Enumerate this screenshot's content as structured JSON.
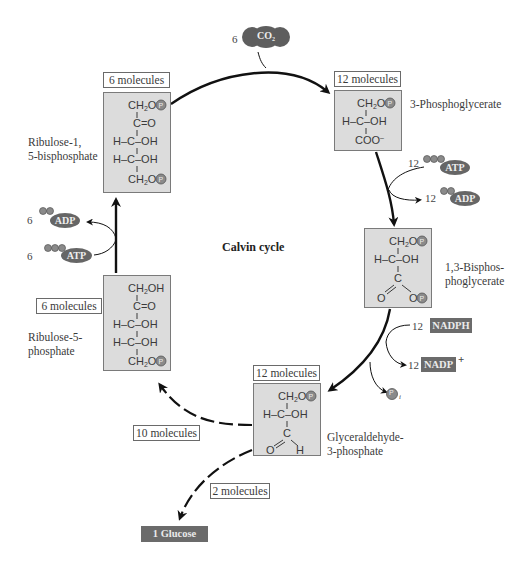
{
  "diagram": {
    "title": "Calvin cycle",
    "colors": {
      "box_fill": "#dcdcdc",
      "box_border": "#7a7a7a",
      "tag_fill": "#6b6b6b",
      "arrow": "#111111"
    },
    "inputs": {
      "co2": {
        "count": "6",
        "label": "CO₂"
      }
    },
    "nodes": {
      "rubp": {
        "count_label": "6 molecules",
        "name_line1": "Ribulose-1,",
        "name_line2": "5-bisphosphate",
        "structure": [
          "CH₂O-P",
          "C=O",
          "H-C-OH",
          "H-C-OH",
          "CH₂O-P"
        ]
      },
      "pga": {
        "count_label": "12 molecules",
        "name_line1": "3-Phosphoglycerate",
        "structure": [
          "CH₂O-P",
          "H-C-OH",
          "COO⁻"
        ]
      },
      "bpg": {
        "name_line1": "1,3-Bisphos-",
        "name_line2": "phoglycerate",
        "structure": [
          "CH₂O-P",
          "H-C-OH",
          "C",
          "O",
          "O-P"
        ]
      },
      "g3p": {
        "count_label": "12 molecules",
        "name_line1": "Glyceraldehyde-",
        "name_line2": "3-phosphate",
        "structure": [
          "CH₂O-P",
          "H-C-OH",
          "C",
          "O",
          "H"
        ]
      },
      "ru5p": {
        "count_label": "6 molecules",
        "name_line1": "Ribulose-5-",
        "name_line2": "phosphate",
        "structure": [
          "CH₂OH",
          "C=O",
          "H-C-OH",
          "H-C-OH",
          "CH₂O-P"
        ]
      }
    },
    "cofactors": {
      "atp_right": {
        "count": "12",
        "label": "ATP"
      },
      "adp_right": {
        "count": "12",
        "label": "ADP"
      },
      "nadph": {
        "count": "12",
        "label": "NADPH"
      },
      "nadp": {
        "count": "12",
        "label": "NADP",
        "superscript": "+"
      },
      "pi": {
        "label": "P",
        "subscript": "i"
      },
      "adp_left": {
        "count": "6",
        "label": "ADP"
      },
      "atp_left": {
        "count": "6",
        "label": "ATP"
      }
    },
    "branches": {
      "recycle": "10 molecules",
      "export": "2 molecules",
      "product": "1 Glucose"
    },
    "phosphate_symbol": "P"
  }
}
